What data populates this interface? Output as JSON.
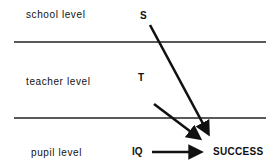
{
  "levels": [
    {
      "id": "school",
      "label": "school level",
      "variable": "S"
    },
    {
      "id": "teacher",
      "label": "teacher level",
      "variable": "T"
    },
    {
      "id": "pupil",
      "label": "pupil level",
      "variable": "IQ"
    }
  ],
  "outcome": "SUCCESS",
  "arrows": [
    {
      "from": "S",
      "to": "SUCCESS"
    },
    {
      "from": "T",
      "to": "SUCCESS"
    },
    {
      "from": "IQ",
      "to": "SUCCESS"
    }
  ],
  "colors": {
    "line": "#222222",
    "arrow": "#111111",
    "text": "#111111",
    "background": "#ffffff"
  }
}
